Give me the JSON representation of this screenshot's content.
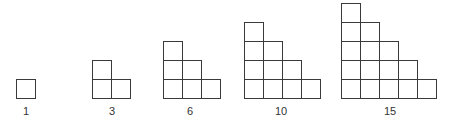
{
  "cell_size": 20,
  "baseline_y": 99,
  "label_y": 105,
  "stroke_color": "#3a3a3a",
  "figures": [
    {
      "n": 1,
      "label": "1",
      "left": 16,
      "label_x": 26
    },
    {
      "n": 2,
      "label": "3",
      "left": 92,
      "label_x": 112
    },
    {
      "n": 3,
      "label": "6",
      "left": 163,
      "label_x": 190
    },
    {
      "n": 4,
      "label": "10",
      "left": 244,
      "label_x": 281
    },
    {
      "n": 5,
      "label": "15",
      "left": 341,
      "label_x": 390
    }
  ]
}
